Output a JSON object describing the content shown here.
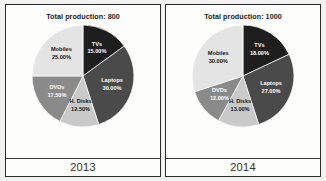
{
  "chart_data": [
    {
      "type": "pie",
      "title": "Total production: 800",
      "caption": "2013",
      "total": 800,
      "categories": [
        "TVs",
        "Laptops",
        "H. Disks",
        "DVDs",
        "Mobiles"
      ],
      "values": [
        15.0,
        30.0,
        12.5,
        17.5,
        25.0
      ],
      "labels": [
        "15.00%",
        "30.00%",
        "12.50%",
        "17.50%",
        "25.00%"
      ],
      "colors": [
        "#1e1e1e",
        "#4a4a4a",
        "#c9c9c9",
        "#8a8a8a",
        "#e4e4e4"
      ],
      "label_tone": [
        "light",
        "light",
        "dark",
        "light",
        "dark"
      ],
      "start_angle": 0,
      "direction": "clockwise",
      "legend": "none",
      "grid": false
    },
    {
      "type": "pie",
      "title": "Total production: 1000",
      "caption": "2014",
      "total": 1000,
      "categories": [
        "TVs",
        "Laptops",
        "H. Disks",
        "DVDs",
        "Mobiles"
      ],
      "values": [
        18.0,
        27.0,
        13.0,
        12.0,
        30.0
      ],
      "labels": [
        "18.00%",
        "27.00%",
        "13.00%",
        "12.00%",
        "30.00%"
      ],
      "colors": [
        "#1e1e1e",
        "#4a4a4a",
        "#c9c9c9",
        "#8a8a8a",
        "#e4e4e4"
      ],
      "label_tone": [
        "light",
        "light",
        "dark",
        "light",
        "dark"
      ],
      "start_angle": 0,
      "direction": "clockwise",
      "legend": "none",
      "grid": false
    }
  ]
}
